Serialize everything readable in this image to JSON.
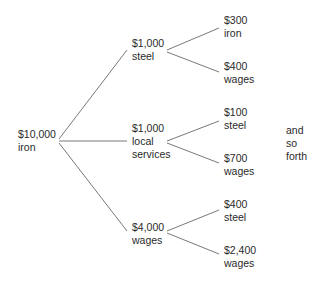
{
  "diagram": {
    "type": "tree",
    "root": {
      "amount": "$10,000",
      "label": "iron"
    },
    "level1": [
      {
        "amount": "$1,000",
        "label": "steel",
        "label2": ""
      },
      {
        "amount": "$1,000",
        "label": "local",
        "label2": "services"
      },
      {
        "amount": "$4,000",
        "label": "wages",
        "label2": ""
      }
    ],
    "level2": [
      {
        "amount": "$300",
        "label": "iron"
      },
      {
        "amount": "$400",
        "label": "wages"
      },
      {
        "amount": "$100",
        "label": "steel"
      },
      {
        "amount": "$700",
        "label": "wages"
      },
      {
        "amount": "$400",
        "label": "steel"
      },
      {
        "amount": "$2,400",
        "label": "wages"
      }
    ],
    "annotation": {
      "line1": "and",
      "line2": "so",
      "line3": "forth"
    },
    "edge_color": "#555555"
  }
}
